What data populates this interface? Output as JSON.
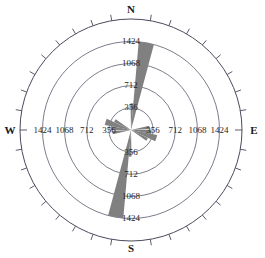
{
  "chart_data": {
    "type": "rose",
    "title": "",
    "subtitle": "",
    "xlabel": "",
    "ylabel": "",
    "grid": true,
    "legend": null,
    "center": {
      "x": 131,
      "y": 130
    },
    "outer_radius_px": 111,
    "radial_axis": {
      "max": 1424,
      "min": 0,
      "tick_values": [
        356,
        712,
        1068,
        1424
      ],
      "tick_labels": [
        "356",
        "712",
        "1068",
        "1424"
      ],
      "labeled_axes": [
        "N",
        "S",
        "W",
        "E"
      ]
    },
    "angular_axis": {
      "cardinals": [
        "N",
        "E",
        "S",
        "W"
      ],
      "tick_interval_deg": 10,
      "direction": "clockwise",
      "zero_at": "top"
    },
    "petals": [
      {
        "name": "NNE-main",
        "azimuth_deg": 10,
        "width_deg": 10,
        "value": 1424
      },
      {
        "name": "N-minor",
        "azimuth_deg": 2,
        "width_deg": 6,
        "value": 430
      },
      {
        "name": "SSW-main",
        "azimuth_deg": 190,
        "width_deg": 10,
        "value": 1424
      },
      {
        "name": "S-minor",
        "azimuth_deg": 182,
        "width_deg": 6,
        "value": 430
      },
      {
        "name": "WNW-lobe",
        "azimuth_deg": 288,
        "width_deg": 14,
        "value": 430
      },
      {
        "name": "WNW-lobe-b",
        "azimuth_deg": 275,
        "width_deg": 12,
        "value": 330
      },
      {
        "name": "W-lobe",
        "azimuth_deg": 262,
        "width_deg": 10,
        "value": 300
      },
      {
        "name": "NW-lobe",
        "azimuth_deg": 300,
        "width_deg": 10,
        "value": 300
      },
      {
        "name": "ESE-lobe",
        "azimuth_deg": 108,
        "width_deg": 14,
        "value": 430
      },
      {
        "name": "ESE-lobe-b",
        "azimuth_deg": 95,
        "width_deg": 12,
        "value": 330
      },
      {
        "name": "E-lobe",
        "azimuth_deg": 82,
        "width_deg": 10,
        "value": 300
      },
      {
        "name": "SE-lobe",
        "azimuth_deg": 120,
        "width_deg": 10,
        "value": 300
      }
    ]
  },
  "cardinals": {
    "north": "N",
    "south": "S",
    "west": "W",
    "east": "E"
  },
  "radial_labels": {
    "north": [
      "1424",
      "1068",
      "712",
      "356"
    ],
    "south": [
      "356",
      "712",
      "1068",
      "1424"
    ],
    "west": [
      "1424",
      "1068",
      "712",
      "356"
    ],
    "east": [
      "356",
      "712",
      "1068",
      "1424"
    ]
  },
  "colors": {
    "petal": "#808080",
    "grid": "#5a5a6e",
    "text": "#1a1a1a",
    "background": "#ffffff"
  }
}
